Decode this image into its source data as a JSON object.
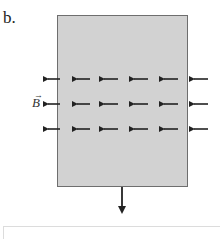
{
  "part_label": "b.",
  "field_label": "B",
  "field_vector_mark": "→",
  "diagram": {
    "region_color": "#d2d2d2",
    "border_color": "#6e6e6e",
    "field_direction": "left",
    "field_rows": 3,
    "field_columns": 6,
    "velocity_direction": "down"
  },
  "answer_box": {
    "value": ""
  }
}
